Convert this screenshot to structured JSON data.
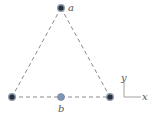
{
  "diagram": {
    "type": "equilateral triangle of wires",
    "points": {
      "a": {
        "label": "a"
      },
      "b": {
        "label": "b"
      }
    },
    "axes": {
      "x_label": "x",
      "y_label": "y"
    },
    "colors": {
      "line": "#8a8a8a",
      "wire_fill": "#2a2f3a",
      "wire_ring": "#8d9bb0",
      "point_b_fill": "#7f93b3",
      "label": "#555555"
    }
  }
}
